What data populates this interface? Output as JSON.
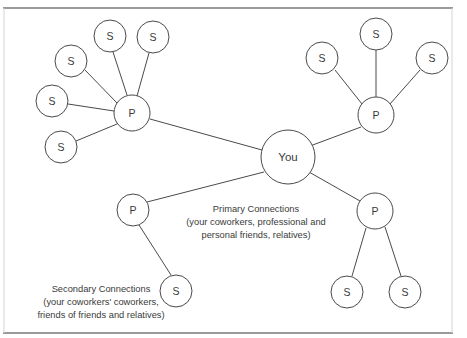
{
  "diagram": {
    "type": "node-link-network",
    "background_color": "#ffffff",
    "stroke_color": "#4a4a4a",
    "frame_color": "#9a9a9a",
    "center_node": {
      "id": "you",
      "label": "You",
      "cx": 288,
      "cy": 157,
      "r": 27
    },
    "primary_nodes": [
      {
        "id": "p-left",
        "label": "P",
        "cx": 132,
        "cy": 113,
        "r": 18
      },
      {
        "id": "p-top-right",
        "label": "P",
        "cx": 376,
        "cy": 115,
        "r": 18
      },
      {
        "id": "p-bottom-right",
        "label": "P",
        "cx": 375,
        "cy": 211,
        "r": 18
      },
      {
        "id": "p-bottom-left",
        "label": "P",
        "cx": 133,
        "cy": 210,
        "r": 16
      }
    ],
    "secondary_nodes": [
      {
        "id": "s-l1",
        "label": "S",
        "cx": 110,
        "cy": 36,
        "r": 16,
        "parent": "p-left"
      },
      {
        "id": "s-l2",
        "label": "S",
        "cx": 153,
        "cy": 37,
        "r": 16,
        "parent": "p-left"
      },
      {
        "id": "s-l3",
        "label": "S",
        "cx": 71,
        "cy": 61,
        "r": 16,
        "parent": "p-left"
      },
      {
        "id": "s-l4",
        "label": "S",
        "cx": 52,
        "cy": 101,
        "r": 16,
        "parent": "p-left"
      },
      {
        "id": "s-l5",
        "label": "S",
        "cx": 61,
        "cy": 147,
        "r": 16,
        "parent": "p-left"
      },
      {
        "id": "s-r1",
        "label": "S",
        "cx": 322,
        "cy": 58,
        "r": 16,
        "parent": "p-top-right"
      },
      {
        "id": "s-r2",
        "label": "S",
        "cx": 376,
        "cy": 34,
        "r": 16,
        "parent": "p-top-right"
      },
      {
        "id": "s-r3",
        "label": "S",
        "cx": 432,
        "cy": 58,
        "r": 16,
        "parent": "p-top-right"
      },
      {
        "id": "s-b1",
        "label": "S",
        "cx": 347,
        "cy": 292,
        "r": 16,
        "parent": "p-bottom-right"
      },
      {
        "id": "s-b2",
        "label": "S",
        "cx": 405,
        "cy": 292,
        "r": 16,
        "parent": "p-bottom-right"
      },
      {
        "id": "s-bl1",
        "label": "S",
        "cx": 176,
        "cy": 291,
        "r": 16,
        "parent": "p-bottom-left"
      }
    ],
    "edges": [
      {
        "from": "you",
        "to": "p-left"
      },
      {
        "from": "you",
        "to": "p-top-right"
      },
      {
        "from": "you",
        "to": "p-bottom-right"
      },
      {
        "from": "you",
        "to": "p-bottom-left"
      },
      {
        "from": "p-left",
        "to": "s-l1"
      },
      {
        "from": "p-left",
        "to": "s-l2"
      },
      {
        "from": "p-left",
        "to": "s-l3"
      },
      {
        "from": "p-left",
        "to": "s-l4"
      },
      {
        "from": "p-left",
        "to": "s-l5"
      },
      {
        "from": "p-top-right",
        "to": "s-r1"
      },
      {
        "from": "p-top-right",
        "to": "s-r2"
      },
      {
        "from": "p-top-right",
        "to": "s-r3"
      },
      {
        "from": "p-bottom-right",
        "to": "s-b1"
      },
      {
        "from": "p-bottom-right",
        "to": "s-b2"
      },
      {
        "from": "p-bottom-left",
        "to": "s-bl1"
      }
    ],
    "frame": {
      "x1": 3,
      "y1": 8,
      "x2": 453,
      "y2": 333
    },
    "captions": {
      "primary": {
        "line1": "Primary Connections",
        "line2": "(your coworkers, professional and",
        "line3": "personal friends, relatives)"
      },
      "secondary": {
        "line1": "Secondary Connections",
        "line2": "(your coworkers' coworkers,",
        "line3": "friends of friends and relatives)"
      }
    }
  }
}
